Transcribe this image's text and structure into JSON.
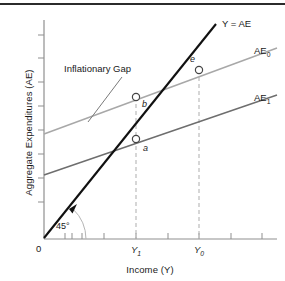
{
  "figure": {
    "background_color": "#ffffff",
    "border_color": "#2b2b2b"
  },
  "axes": {
    "y_title": "Aggregate Expenditures (AE)",
    "x_title": "Income (Y)",
    "origin_label": "0",
    "axis_color": "#8f8f8f",
    "x_ticks": [
      {
        "label": "",
        "x": 65
      },
      {
        "label": "",
        "x": 82
      },
      {
        "label": "",
        "x": 100
      },
      {
        "label": "Y",
        "sub": "1",
        "x": 136
      },
      {
        "label": "",
        "x": 168
      },
      {
        "label": "Y",
        "sub": "0",
        "x": 199
      },
      {
        "label": "",
        "x": 231
      },
      {
        "label": "",
        "x": 262
      }
    ],
    "y_ticks": [
      35,
      58,
      82,
      106,
      130,
      154,
      178,
      202
    ]
  },
  "curves": [
    {
      "name": "forty-five-degree-line",
      "label": "Y = AE",
      "label_sub": "",
      "color": "#111111",
      "width": 2.1,
      "x1": 44,
      "y1": 238,
      "x2": 216,
      "y2": 24,
      "label_x": 222,
      "label_y": 27
    },
    {
      "name": "ae0-curve",
      "label": "AE",
      "label_sub": "0",
      "color": "#a8a8a8",
      "width": 1.5,
      "x1": 44,
      "y1": 134,
      "x2": 277,
      "y2": 48,
      "label_x": 254,
      "label_y": 54
    },
    {
      "name": "ae1-curve",
      "label": "AE",
      "label_sub": "1",
      "color": "#6e6e6e",
      "width": 1.5,
      "x1": 44,
      "y1": 175,
      "x2": 277,
      "y2": 95,
      "label_x": 254,
      "label_y": 101
    }
  ],
  "points": [
    {
      "name": "point-e",
      "label": "e",
      "x": 199,
      "y": 70,
      "label_x": 190,
      "label_y": 62
    },
    {
      "name": "point-b",
      "label": "b",
      "x": 136,
      "y": 97,
      "label_x": 142,
      "label_y": 107
    },
    {
      "name": "point-a",
      "label": "a",
      "x": 136,
      "y": 139,
      "label_x": 143,
      "label_y": 151
    }
  ],
  "dashed_lines": [
    {
      "name": "y1-dashed-line",
      "x": 136,
      "y_top": 97,
      "y_bottom": 239
    },
    {
      "name": "y0-dashed-line",
      "x": 199,
      "y_top": 70,
      "y_bottom": 239
    }
  ],
  "annotations": [
    {
      "name": "inflationary-gap-annotation",
      "text": "Inflationary Gap",
      "text_x": 64,
      "text_y": 72,
      "leader_x1": 122,
      "leader_y1": 77,
      "leader_x2": 88,
      "leader_y2": 122
    }
  ],
  "angle": {
    "label": "45°",
    "label_x": 56,
    "label_y": 229,
    "arc_radius": 42,
    "vertex_x": 44,
    "vertex_y": 239,
    "arrow_x": 74,
    "arrow_y": 207
  }
}
